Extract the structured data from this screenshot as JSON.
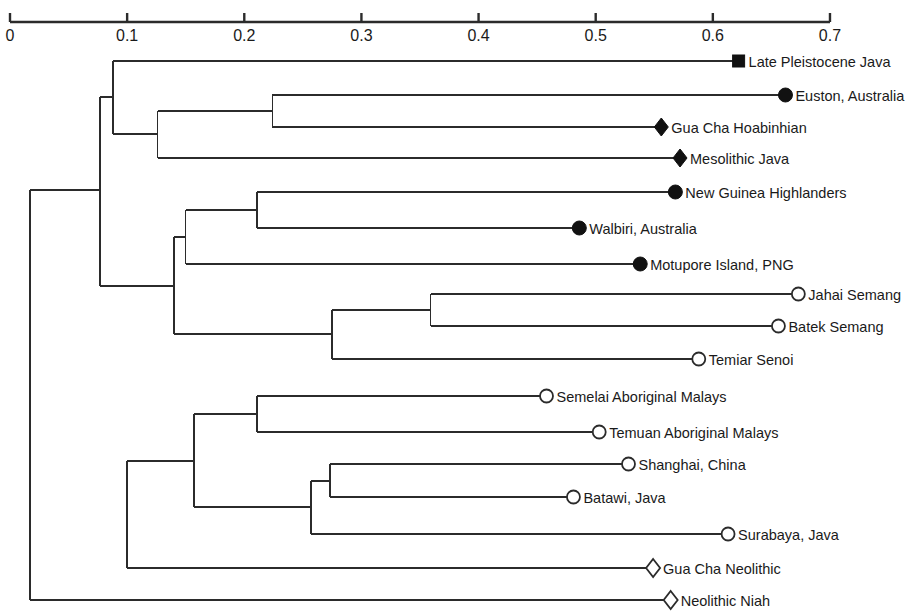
{
  "chart_data": {
    "type": "dendrogram",
    "title": "",
    "xlabel": "",
    "ylabel": "",
    "xlim": [
      0,
      0.7
    ],
    "grid": false,
    "legend_position": "none",
    "axis": {
      "position": "top",
      "ticks": [
        0,
        0.1,
        0.2,
        0.3,
        0.4,
        0.5,
        0.6,
        0.7
      ],
      "tick_labels": [
        "0",
        "0.1",
        "0.2",
        "0.3",
        "0.4",
        "0.5",
        "0.6",
        "0.7"
      ],
      "pixel_x0": 10,
      "pixel_per_unit": 1171.4
    },
    "marker_types": {
      "filled-square": "Late Pleistocene fossil",
      "filled-circle": "Australo-Papuan recent",
      "filled-diamond": "Hoabinhian / Mesolithic",
      "open-circle": "Recent Southeast Asian",
      "open-diamond": "Neolithic"
    },
    "leaves": [
      {
        "label": "Late Pleistocene Java",
        "marker": "filled-square",
        "x": 0.622,
        "y": 61,
        "label_side": "right"
      },
      {
        "label": "Euston, Australia",
        "marker": "filled-circle",
        "x": 0.662,
        "y": 95,
        "label_side": "right"
      },
      {
        "label": "Gua Cha Hoabinhian",
        "marker": "filled-diamond",
        "x": 0.556,
        "y": 127,
        "label_side": "right"
      },
      {
        "label": "Mesolithic Java",
        "marker": "filled-diamond",
        "x": 0.572,
        "y": 158,
        "label_side": "right"
      },
      {
        "label": "New Guinea Highlanders",
        "marker": "filled-circle",
        "x": 0.568,
        "y": 192,
        "label_side": "right"
      },
      {
        "label": "Walbiri, Australia",
        "marker": "filled-circle",
        "x": 0.486,
        "y": 228,
        "label_side": "right"
      },
      {
        "label": "Motupore Island, PNG",
        "marker": "filled-circle",
        "x": 0.538,
        "y": 264,
        "label_side": "right"
      },
      {
        "label": "Jahai Semang",
        "marker": "open-circle",
        "x": 0.673,
        "y": 294,
        "label_side": "right"
      },
      {
        "label": "Batek Semang",
        "marker": "open-circle",
        "x": 0.656,
        "y": 326,
        "label_side": "right"
      },
      {
        "label": "Temiar Senoi",
        "marker": "open-circle",
        "x": 0.588,
        "y": 359,
        "label_side": "right"
      },
      {
        "label": "Semelai Aboriginal Malays",
        "marker": "open-circle",
        "x": 0.458,
        "y": 396,
        "label_side": "right"
      },
      {
        "label": "Temuan Aboriginal Malays",
        "marker": "open-circle",
        "x": 0.503,
        "y": 432,
        "label_side": "right"
      },
      {
        "label": "Shanghai, China",
        "marker": "open-circle",
        "x": 0.528,
        "y": 464,
        "label_side": "right"
      },
      {
        "label": "Batawi, Java",
        "marker": "open-circle",
        "x": 0.481,
        "y": 497,
        "label_side": "right"
      },
      {
        "label": "Surabaya, Java",
        "marker": "open-circle",
        "x": 0.613,
        "y": 534,
        "label_side": "right"
      },
      {
        "label": "Gua Cha Neolithic",
        "marker": "open-diamond",
        "x": 0.549,
        "y": 568,
        "label_side": "right"
      },
      {
        "label": "Neolithic Niah",
        "marker": "open-diamond",
        "x": 0.564,
        "y": 600,
        "label_side": "right"
      }
    ],
    "nodes": [
      {
        "id": "n_euston_guacha",
        "x": 0.224,
        "children_y": [
          95,
          127
        ]
      },
      {
        "id": "n_meso_group",
        "x": 0.126,
        "children_y": [
          111,
          158
        ]
      },
      {
        "id": "n_top4",
        "x": 0.088,
        "children_y": [
          61,
          134
        ]
      },
      {
        "id": "n_ngh_walbiri",
        "x": 0.211,
        "children_y": [
          192,
          228
        ]
      },
      {
        "id": "n_papuan",
        "x": 0.15,
        "children_y": [
          210,
          264
        ]
      },
      {
        "id": "n_semang",
        "x": 0.359,
        "children_y": [
          294,
          326
        ]
      },
      {
        "id": "n_senoi",
        "x": 0.275,
        "children_y": [
          310,
          359
        ]
      },
      {
        "id": "n_papuan_senoi",
        "x": 0.14,
        "children_y": [
          237,
          334
        ]
      },
      {
        "id": "n_upper",
        "x": 0.077,
        "children_y": [
          97,
          286
        ]
      },
      {
        "id": "n_malays",
        "x": 0.211,
        "children_y": [
          396,
          432
        ]
      },
      {
        "id": "n_shanghai_bat",
        "x": 0.273,
        "children_y": [
          464,
          497
        ]
      },
      {
        "id": "n_surabaya",
        "x": 0.257,
        "children_y": [
          481,
          534
        ]
      },
      {
        "id": "n_lower_asian",
        "x": 0.157,
        "children_y": [
          414,
          507
        ]
      },
      {
        "id": "n_neolithic",
        "x": 0.1,
        "children_y": [
          461,
          568
        ]
      },
      {
        "id": "n_root",
        "x": 0.017,
        "children_y": [
          190,
          600
        ]
      }
    ]
  },
  "figure": {
    "background_color": "#ffffff",
    "line_color": "#2b2b2b",
    "text_color": "#1a1a1a",
    "marker_fill_dark": "#111111",
    "marker_fill_light": "#ffffff"
  }
}
